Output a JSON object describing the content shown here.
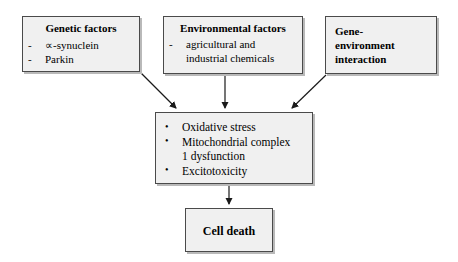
{
  "diagram": {
    "type": "flowchart",
    "title": "",
    "boxes": [
      {
        "id": "genetic",
        "title": "Genetic factors",
        "marker": "-",
        "items": [
          "∝-synuclein",
          "Parkin"
        ]
      },
      {
        "id": "environment",
        "title": "Environmental factors",
        "marker": "-",
        "items": [
          "agricultural and",
          "industrial chemicals"
        ]
      },
      {
        "id": "gene_environment",
        "title_lines": [
          "Gene-",
          "environment",
          "interaction"
        ]
      },
      {
        "id": "mechanisms",
        "bullet": "•",
        "items": [
          "Oxidative stress",
          "Mitochondrial complex",
          "1 dysfunction",
          "Excitotoxicity"
        ]
      },
      {
        "id": "cell_death",
        "label": "Cell death"
      }
    ],
    "edges": [
      {
        "from": "genetic",
        "to": "mechanisms"
      },
      {
        "from": "environment",
        "to": "mechanisms"
      },
      {
        "from": "gene_environment",
        "to": "mechanisms"
      },
      {
        "from": "mechanisms",
        "to": "cell_death"
      }
    ],
    "colors": {
      "box_fill": "#f0f0f0",
      "box_border": "#4a4a4a",
      "box_shadow": "#b9b9b9",
      "arrow": "#1a1a1a",
      "text": "#000000",
      "background": "#ffffff"
    }
  }
}
